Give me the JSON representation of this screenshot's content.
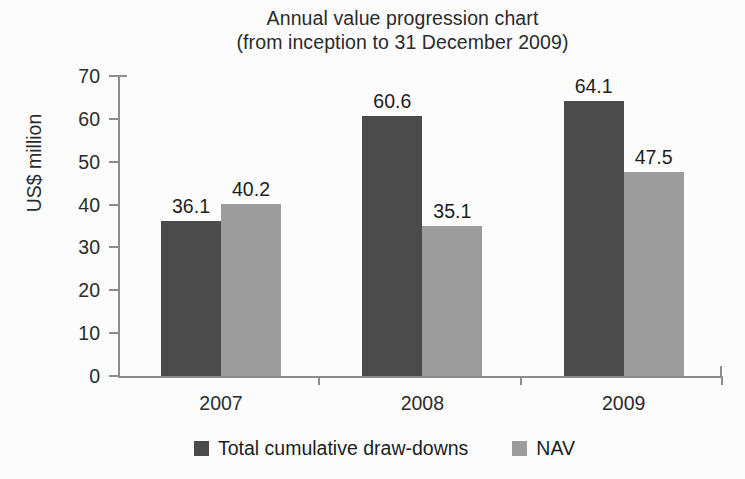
{
  "chart_data": {
    "type": "bar",
    "title": "Annual value progression chart (from inception to 31 December 2009)",
    "title_lines": [
      "Annual value progression chart",
      "(from inception to 31 December 2009)"
    ],
    "categories": [
      "2007",
      "2008",
      "2009"
    ],
    "series": [
      {
        "name": "Total cumulative draw-downs",
        "color": "#4b4b4b",
        "values": [
          36.1,
          40.2,
          60.6
        ],
        "value_labels": [
          "36.1",
          "60.6",
          "64.1"
        ]
      },
      {
        "name": "NAV",
        "color": "#9c9c9c",
        "values": [
          40.2,
          35.1,
          47.5
        ],
        "value_labels": [
          "40.2",
          "35.1",
          "47.5"
        ]
      }
    ],
    "points": [
      {
        "category": "2007",
        "total_cumulative_draw_downs": 36.1,
        "nav": 40.2
      },
      {
        "category": "2008",
        "total_cumulative_draw_downs": 60.6,
        "nav": 35.1
      },
      {
        "category": "2009",
        "total_cumulative_draw_downs": 64.1,
        "nav": 47.5
      }
    ],
    "xlabel": "",
    "ylabel": "US$ million",
    "ylim": [
      0,
      70
    ],
    "yticks": [
      "0",
      "10",
      "20",
      "30",
      "40",
      "50",
      "60",
      "70"
    ],
    "ytick_values": [
      0,
      10,
      20,
      30,
      40,
      50,
      60,
      70
    ],
    "grid": false,
    "legend_position": "bottom",
    "legend": [
      "Total cumulative draw-downs",
      "NAV"
    ],
    "colors": {
      "series_0": "#4b4b4b",
      "series_1": "#9c9c9c",
      "axis": "#8d8d8d",
      "text": "#1c1c1c",
      "background": "#fcfcfc"
    }
  }
}
